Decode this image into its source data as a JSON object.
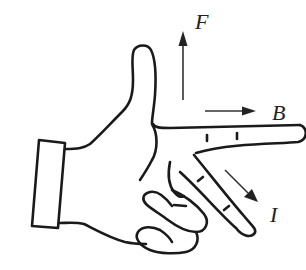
{
  "diagram": {
    "labels": {
      "force": "F",
      "field": "B",
      "current": "I"
    },
    "arrows": [
      {
        "name": "force-arrow",
        "label": "F",
        "direction": "up",
        "finger": "thumb"
      },
      {
        "name": "field-arrow",
        "label": "B",
        "direction": "right",
        "finger": "index"
      },
      {
        "name": "current-arrow",
        "label": "I",
        "direction": "down-right",
        "finger": "middle"
      }
    ],
    "colors": {
      "stroke": "#1a1a1a",
      "background": "#ffffff"
    }
  }
}
